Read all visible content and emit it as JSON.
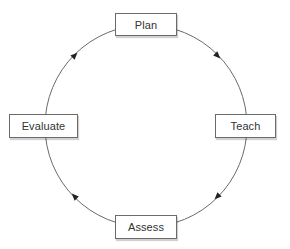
{
  "diagram": {
    "type": "cycle",
    "direction": "clockwise",
    "nodes": [
      {
        "id": "plan",
        "label": "Plan",
        "position": "top"
      },
      {
        "id": "teach",
        "label": "Teach",
        "position": "right"
      },
      {
        "id": "assess",
        "label": "Assess",
        "position": "bottom"
      },
      {
        "id": "evaluate",
        "label": "Evaluate",
        "position": "left"
      }
    ],
    "edges": [
      {
        "from": "Plan",
        "to": "Teach"
      },
      {
        "from": "Teach",
        "to": "Assess"
      },
      {
        "from": "Assess",
        "to": "Evaluate"
      },
      {
        "from": "Evaluate",
        "to": "Plan"
      }
    ],
    "colors": {
      "line": "#6a6a6a",
      "arrow": "#222222",
      "box_border": "#6a6a6a",
      "text": "#333333"
    }
  }
}
